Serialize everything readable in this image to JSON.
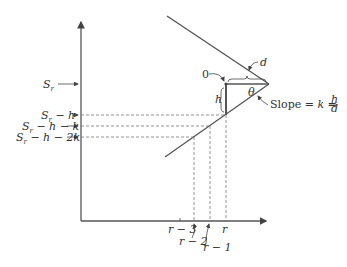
{
  "diagram": {
    "y_axis_labels": {
      "sr": "S",
      "sr_sub": "r",
      "sr_minus_h": " − h",
      "sr_minus_h_minus_k": " − h − k",
      "sr_minus_h_minus_2k": " − h − 2k"
    },
    "x_axis_labels": {
      "r": "r",
      "r_minus_1": "r − 1",
      "r_minus_2": "r − 2",
      "r_minus_3": "r − 3"
    },
    "annotations": {
      "zero": "0",
      "h": "h",
      "d": "d",
      "theta": "θ",
      "slope_prefix": "Slope = ",
      "slope_k": "k",
      "slope_eq": " = ",
      "slope_num": "h",
      "slope_den": "d"
    },
    "colors": {
      "line": "#555555",
      "dash": "#777777",
      "text": "#333333"
    }
  }
}
